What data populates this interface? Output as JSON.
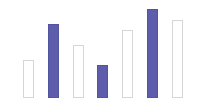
{
  "chart_data": {
    "type": "bar",
    "title": "",
    "subtitle": "",
    "xlabel": "",
    "ylabel": "",
    "categories": [
      "1",
      "2",
      "3",
      "4",
      "5",
      "6",
      "7"
    ],
    "values": [
      38,
      74,
      53,
      33,
      68,
      89,
      78
    ],
    "ylim": [
      0,
      100
    ],
    "grid": false,
    "legend": null,
    "legend_position": "none",
    "axis_ticks": [],
    "annotations": [],
    "series": [
      {
        "name": "bars",
        "values": [
          38,
          74,
          53,
          33,
          68,
          89,
          78
        ],
        "styles": [
          "outline",
          "filled",
          "outline",
          "filled",
          "outline",
          "filled",
          "outline"
        ]
      }
    ],
    "colors": {
      "fill": "#5d5dab",
      "fill_border": "#5354a0",
      "outline_fill": "#ffffff",
      "outline_border": "#d6d6d6",
      "background": "#ffffff"
    },
    "bars": [
      {
        "index": 0,
        "label": "1",
        "value": 38,
        "style": "outline",
        "x": 23,
        "top": 60,
        "width": 11,
        "height": 38
      },
      {
        "index": 1,
        "label": "2",
        "value": 74,
        "style": "filled",
        "x": 48,
        "top": 24,
        "width": 11,
        "height": 74
      },
      {
        "index": 2,
        "label": "3",
        "value": 53,
        "style": "outline",
        "x": 73,
        "top": 45,
        "width": 11,
        "height": 53
      },
      {
        "index": 3,
        "label": "4",
        "value": 33,
        "style": "filled",
        "x": 97,
        "top": 65,
        "width": 11,
        "height": 33
      },
      {
        "index": 4,
        "label": "5",
        "value": 68,
        "style": "outline",
        "x": 122,
        "top": 30,
        "width": 11,
        "height": 68
      },
      {
        "index": 5,
        "label": "6",
        "value": 89,
        "style": "filled",
        "x": 147,
        "top": 9,
        "width": 11,
        "height": 89
      },
      {
        "index": 6,
        "label": "7",
        "value": 78,
        "style": "outline",
        "x": 172,
        "top": 20,
        "width": 11,
        "height": 78
      }
    ],
    "baseline_y": 98
  }
}
